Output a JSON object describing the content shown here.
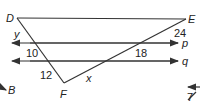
{
  "diagram": {
    "points": {
      "D": "D",
      "E": "E",
      "F": "F"
    },
    "lines": {
      "p": "p",
      "q": "q"
    },
    "segment_labels": {
      "y": "y",
      "ten": "10",
      "twelve": "12",
      "x": "x",
      "twentyfour": "24",
      "eighteen": "18"
    },
    "partial_labels": {
      "B": "B",
      "seven": "7"
    },
    "colors": {
      "stroke": "#333333",
      "text": "#222222"
    }
  }
}
